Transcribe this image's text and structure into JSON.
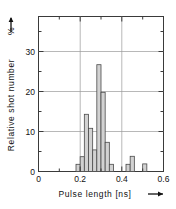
{
  "chart_data": {
    "type": "bar",
    "title": "",
    "subtitle": "",
    "xlabel": "Pulse  length  [ns]",
    "ylabel": "Relative shot number",
    "ylabel_unit": "%",
    "xlabel_arrow": "⟶",
    "ylabel_arrow": "⟶",
    "xlim": [
      0,
      0.6
    ],
    "ylim": [
      0,
      35.5
    ],
    "bin_width": 0.02,
    "grid": true,
    "grid_x": [
      0.2,
      0.4
    ],
    "grid_y": [
      10,
      20,
      30
    ],
    "legend": "none",
    "xticks": [
      0,
      0.2,
      0.4,
      0.6
    ],
    "xticklabels": [
      "0",
      "0.2",
      "0.4",
      "0.6"
    ],
    "xminorticks": [
      0.1,
      0.3,
      0.5
    ],
    "yticks": [
      0,
      10,
      20,
      30
    ],
    "yticklabels": [
      "0",
      "10",
      "20",
      "30"
    ],
    "yminorticks": [
      5,
      15,
      25,
      35
    ],
    "bar_color": "#d2d2d2",
    "bar_edge_color": "#4a4a4a",
    "axis_color": "#3a3a3a",
    "grid_color": "#9a9a9a",
    "x": [
      0.18,
      0.2,
      0.22,
      0.24,
      0.26,
      0.28,
      0.3,
      0.32,
      0.34,
      0.36,
      0.42,
      0.44,
      0.5
    ],
    "values": [
      1.8,
      3.7,
      14.3,
      10.8,
      5.4,
      26.7,
      19.8,
      7.3,
      1.8,
      0.0,
      1.8,
      3.8,
      1.9
    ],
    "bars": [
      {
        "x": 0.18,
        "value": 1.8
      },
      {
        "x": 0.2,
        "value": 3.7
      },
      {
        "x": 0.22,
        "value": 14.3
      },
      {
        "x": 0.24,
        "value": 10.8
      },
      {
        "x": 0.26,
        "value": 5.4
      },
      {
        "x": 0.28,
        "value": 26.7
      },
      {
        "x": 0.3,
        "value": 19.8
      },
      {
        "x": 0.32,
        "value": 7.3
      },
      {
        "x": 0.34,
        "value": 1.8
      },
      {
        "x": 0.42,
        "value": 1.8
      },
      {
        "x": 0.44,
        "value": 3.8
      },
      {
        "x": 0.5,
        "value": 1.9
      }
    ]
  }
}
